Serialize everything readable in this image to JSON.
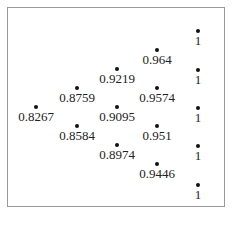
{
  "title": "",
  "diagram": {
    "type": "binomial-tree",
    "columns_x": [
      36,
      77,
      117,
      157,
      198
    ],
    "nodes": [
      {
        "label": "0.8267",
        "x": 36,
        "y": 107
      },
      {
        "label": "0.8759",
        "x": 77,
        "y": 88
      },
      {
        "label": "0.8584",
        "x": 77,
        "y": 126
      },
      {
        "label": "0.9219",
        "x": 117,
        "y": 69
      },
      {
        "label": "0.9095",
        "x": 117,
        "y": 107
      },
      {
        "label": "0.8974",
        "x": 117,
        "y": 145
      },
      {
        "label": "0.964",
        "x": 157,
        "y": 50
      },
      {
        "label": "0.9574",
        "x": 157,
        "y": 88
      },
      {
        "label": "0.951",
        "x": 157,
        "y": 126
      },
      {
        "label": "0.9446",
        "x": 157,
        "y": 164
      },
      {
        "label": "1",
        "x": 198,
        "y": 31
      },
      {
        "label": "1",
        "x": 198,
        "y": 70
      },
      {
        "label": "1",
        "x": 198,
        "y": 108
      },
      {
        "label": "1",
        "x": 198,
        "y": 146
      },
      {
        "label": "1",
        "x": 198,
        "y": 185
      }
    ]
  }
}
